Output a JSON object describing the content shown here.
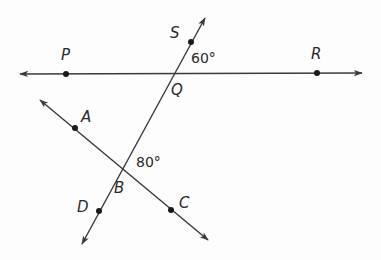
{
  "diagram": {
    "type": "geometry",
    "colors": {
      "line": "#3a3a3a",
      "text": "#2a2a2a",
      "background": "#fdfdfd"
    },
    "points": {
      "P": {
        "label": "P"
      },
      "R": {
        "label": "R"
      },
      "S": {
        "label": "S"
      },
      "Q": {
        "label": "Q"
      },
      "A": {
        "label": "A"
      },
      "B": {
        "label": "B"
      },
      "C": {
        "label": "C"
      },
      "D": {
        "label": "D"
      }
    },
    "lines": [
      {
        "name": "line PR",
        "through": [
          "P",
          "Q",
          "R"
        ]
      },
      {
        "name": "line SD",
        "through": [
          "S",
          "Q",
          "B",
          "D"
        ]
      },
      {
        "name": "line AC",
        "through": [
          "A",
          "B",
          "C"
        ]
      }
    ],
    "angles": {
      "SQR": {
        "label": "60°",
        "vertex": "Q"
      },
      "QBC": {
        "label": "80°",
        "vertex": "B"
      }
    }
  }
}
